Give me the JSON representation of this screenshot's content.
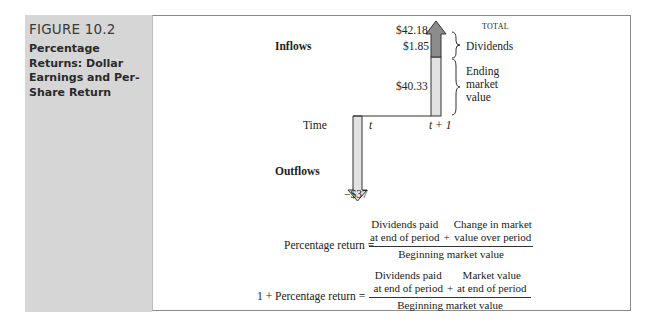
{
  "figure": {
    "number": "FIGURE 10.2",
    "title": "Percentage Returns: Dollar Earnings and Per-Share Return"
  },
  "diagram": {
    "inflows_label": "Inflows",
    "outflows_label": "Outflows",
    "time_label": "Time",
    "t_label": "t",
    "t1_label": "t + 1",
    "total_caption": "TOTAL",
    "total_value": "$42.18",
    "dividends_value": "$1.85",
    "dividends_label": "Dividends",
    "ending_value": "$40.33",
    "ending_label_lines": [
      "Ending",
      "market",
      "value"
    ],
    "outflow_value": "−$37",
    "colors": {
      "sidebar": "#d6d6d6",
      "bar_light": "#e2e2e2",
      "bar_dark": "#8c8c8c",
      "line": "#333333"
    }
  },
  "formulas": {
    "f1": {
      "lhs": "Percentage return =",
      "num_left": [
        "Dividends paid",
        "at end of period"
      ],
      "plus": "+",
      "num_right": [
        "Change in market",
        "value over period"
      ],
      "den": "Beginning market value"
    },
    "f2": {
      "lhs": "1 + Percentage return =",
      "num_left": [
        "Dividends paid",
        "at end of period"
      ],
      "plus": "+",
      "num_right": [
        "Market value",
        "at end of period"
      ],
      "den": "Beginning market value"
    }
  }
}
